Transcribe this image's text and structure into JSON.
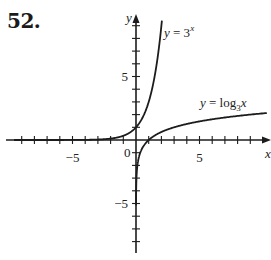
{
  "problem": {
    "number_label": "52."
  },
  "chart_data": {
    "type": "line",
    "title": "",
    "xlabel": "x",
    "ylabel": "y",
    "xlim": [
      -9.5,
      10.5
    ],
    "ylim": [
      -8.8,
      9.8
    ],
    "grid": false,
    "x_ticks": [
      -9,
      -8,
      -7,
      -6,
      -5,
      -4,
      -3,
      -2,
      -1,
      1,
      2,
      3,
      4,
      5,
      6,
      7,
      8,
      9
    ],
    "y_ticks": [
      -8,
      -7,
      -6,
      -5,
      -4,
      -3,
      -2,
      -1,
      1,
      2,
      3,
      4,
      5,
      6,
      7,
      8,
      9
    ],
    "x_tick_labels": [
      {
        "value": -5,
        "label": "−5"
      },
      {
        "value": 5,
        "label": "5"
      }
    ],
    "y_tick_labels": [
      {
        "value": 5,
        "label": "5"
      },
      {
        "value": -5,
        "label": "−5"
      }
    ],
    "origin_label": "0",
    "series": [
      {
        "name": "y = 3^x",
        "label_text": "y = 3",
        "label_superscript": "x",
        "x": [
          -9.0,
          -7.0,
          -5.0,
          -3.0,
          -2.0,
          -1.0,
          0.0,
          0.5,
          1.0,
          1.5,
          1.8,
          2.04
        ],
        "values": [
          0.0001,
          0.0005,
          0.004,
          0.037,
          0.111,
          0.333,
          1.0,
          1.732,
          3.0,
          5.196,
          7.225,
          9.4
        ]
      },
      {
        "name": "y = log_3 x",
        "label_text": "y = log",
        "label_subscript": "3",
        "label_tail": "x",
        "x": [
          0.003,
          0.01,
          0.05,
          0.1,
          0.2,
          0.33,
          0.5,
          1.0,
          2.0,
          3.0,
          5.0,
          7.0,
          9.0,
          10.3
        ],
        "values": [
          -5.29,
          -4.19,
          -2.73,
          -2.1,
          -1.46,
          -1.01,
          -0.63,
          0.0,
          0.63,
          1.0,
          1.46,
          1.77,
          2.0,
          2.12
        ]
      }
    ],
    "legend": "inline labels near curves"
  }
}
